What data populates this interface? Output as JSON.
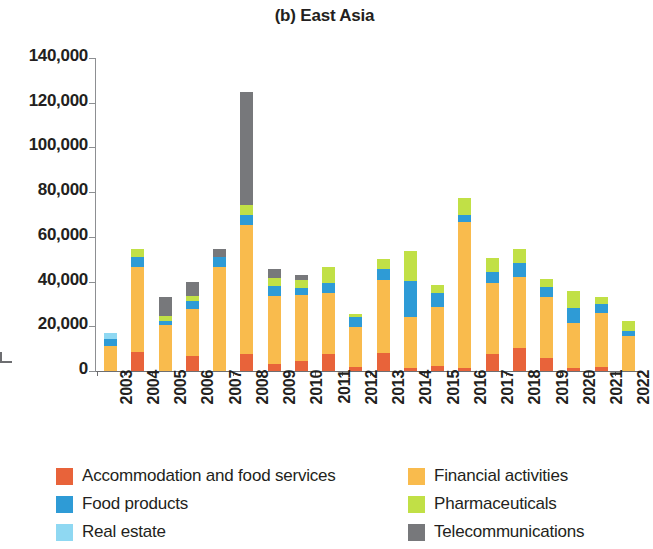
{
  "chart_data": {
    "type": "bar",
    "subtype": "stacked",
    "title": "(b) East Asia",
    "xlabel": "",
    "ylabel": "",
    "ylim": [
      0,
      140000
    ],
    "ytick_step": 20000,
    "grid": false,
    "legend_position": "bottom",
    "ytick_labels": [
      "140,000",
      "120,000",
      "100,000",
      "80,000",
      "60,000",
      "40,000",
      "20,000",
      "0"
    ],
    "ytick_values": [
      140000,
      120000,
      100000,
      80000,
      60000,
      40000,
      20000,
      0
    ],
    "categories": [
      "2003",
      "2004",
      "2005",
      "2006",
      "2007",
      "2008",
      "2009",
      "2010",
      "2011",
      "2012",
      "2013",
      "2014",
      "2015",
      "2016",
      "2017",
      "2018",
      "2019",
      "2020",
      "2021",
      "2022"
    ],
    "series": [
      {
        "name": "Accommodation and food services",
        "color": "#e8633a",
        "values": [
          0,
          8500,
          0,
          6700,
          0,
          7700,
          3200,
          4500,
          7500,
          1800,
          8200,
          1300,
          2200,
          1200,
          7500,
          10200,
          6000,
          1200,
          1900,
          0
        ]
      },
      {
        "name": "Financial activities",
        "color": "#f9bb4d",
        "values": [
          11000,
          38000,
          20500,
          21000,
          46500,
          57500,
          30500,
          29500,
          27500,
          18000,
          32500,
          23000,
          26500,
          65500,
          32000,
          32000,
          27000,
          20500,
          24000,
          15500
        ]
      },
      {
        "name": "Food products",
        "color": "#2e9bd6",
        "values": [
          3200,
          4500,
          2000,
          3600,
          4500,
          4500,
          4500,
          3200,
          4500,
          4500,
          5000,
          16000,
          6000,
          3000,
          5000,
          6000,
          4500,
          6500,
          4000,
          2500
        ]
      },
      {
        "name": "Real estate",
        "color": "#8fd8f2",
        "values": [
          2600,
          0,
          0,
          0,
          0,
          0,
          0,
          0,
          0,
          0,
          0,
          0,
          0,
          0,
          0,
          0,
          0,
          0,
          0,
          0
        ]
      },
      {
        "name": "Pharmaceuticals",
        "color": "#c1e046",
        "values": [
          0,
          3500,
          2200,
          2200,
          0,
          4500,
          3600,
          3600,
          7200,
          1200,
          4500,
          13500,
          3600,
          7500,
          6000,
          6500,
          3600,
          7500,
          3200,
          4500
        ]
      },
      {
        "name": "Telecommunications",
        "color": "#77787b",
        "values": [
          0,
          0,
          8600,
          6300,
          3600,
          50800,
          4000,
          2200,
          0,
          0,
          0,
          0,
          0,
          0,
          0,
          0,
          0,
          0,
          0,
          0
        ]
      }
    ]
  },
  "legend": {
    "items": [
      {
        "label": "Accommodation and food services",
        "color": "#e8633a"
      },
      {
        "label": "Food products",
        "color": "#2e9bd6"
      },
      {
        "label": "Real estate",
        "color": "#8fd8f2"
      },
      {
        "label": "Financial activities",
        "color": "#f9bb4d"
      },
      {
        "label": "Pharmaceuticals",
        "color": "#c1e046"
      },
      {
        "label": "Telecommunications",
        "color": "#77787b"
      }
    ]
  }
}
